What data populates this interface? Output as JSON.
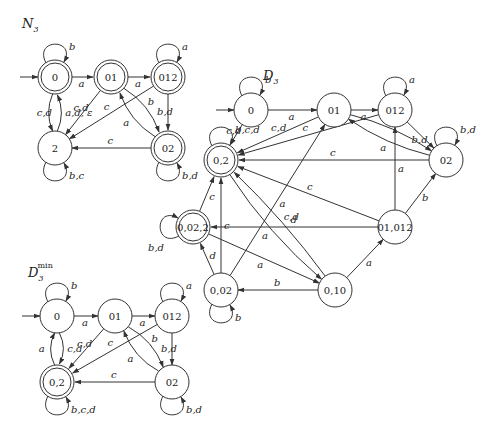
{
  "colors": {
    "stroke": "#333333",
    "text": "#222222",
    "background": "#ffffff"
  },
  "automata": [
    {
      "id": "N3",
      "title": "N",
      "title_sub": "3",
      "title_sup": "",
      "title_pos": [
        22,
        28
      ],
      "states": [
        {
          "id": "0",
          "label": "0",
          "x": 55,
          "y": 77,
          "accepting": true,
          "initial": true
        },
        {
          "id": "01",
          "label": "01",
          "x": 111,
          "y": 77,
          "accepting": true
        },
        {
          "id": "012",
          "label": "012",
          "x": 168,
          "y": 77,
          "accepting": true
        },
        {
          "id": "02",
          "label": "02",
          "x": 168,
          "y": 148,
          "accepting": true
        },
        {
          "id": "2",
          "label": "2",
          "x": 55,
          "y": 148,
          "accepting": false
        }
      ],
      "edges": [
        {
          "from": "0",
          "to": "0",
          "label": "b",
          "loop": "top"
        },
        {
          "from": "0",
          "to": "01",
          "label": "a"
        },
        {
          "from": "01",
          "to": "012",
          "label": "a"
        },
        {
          "from": "012",
          "to": "012",
          "label": "a",
          "loop": "top"
        },
        {
          "from": "0",
          "to": "2",
          "label": "c,d",
          "bend": 8
        },
        {
          "from": "2",
          "to": "0",
          "label": "a,d, ε",
          "bend": 8
        },
        {
          "from": "01",
          "to": "2",
          "label": "c,d"
        },
        {
          "from": "012",
          "to": "2",
          "label": "c"
        },
        {
          "from": "01",
          "to": "02",
          "label": "b",
          "bend": -10
        },
        {
          "from": "02",
          "to": "01",
          "label": "a",
          "bend": -10
        },
        {
          "from": "012",
          "to": "02",
          "label": "b,d"
        },
        {
          "from": "02",
          "to": "2",
          "label": "c"
        },
        {
          "from": "02",
          "to": "02",
          "label": "b,d",
          "loop": "bottom"
        },
        {
          "from": "2",
          "to": "2",
          "label": "b,c",
          "loop": "bottom"
        }
      ]
    },
    {
      "id": "D3",
      "title": "D",
      "title_sub": "3",
      "title_sup": "",
      "title_pos": [
        263,
        80
      ],
      "states": [
        {
          "id": "0",
          "label": "0",
          "x": 251,
          "y": 110,
          "accepting": false,
          "initial": true
        },
        {
          "id": "01",
          "label": "01",
          "x": 334,
          "y": 110,
          "accepting": false
        },
        {
          "id": "012",
          "label": "012",
          "x": 395,
          "y": 110,
          "accepting": false
        },
        {
          "id": "02",
          "label": "02",
          "x": 446,
          "y": 160,
          "accepting": false
        },
        {
          "id": "0,2",
          "label": "0,2",
          "x": 221,
          "y": 160,
          "accepting": true
        },
        {
          "id": "0,02,2",
          "label": "0,02,2",
          "x": 193,
          "y": 227,
          "accepting": true
        },
        {
          "id": "01,012",
          "label": "01,012",
          "x": 395,
          "y": 227,
          "accepting": false
        },
        {
          "id": "0,02",
          "label": "0,02",
          "x": 221,
          "y": 290,
          "accepting": false
        },
        {
          "id": "0,10",
          "label": "0,10",
          "x": 335,
          "y": 290,
          "accepting": false
        }
      ],
      "edges": [
        {
          "from": "0",
          "to": "0",
          "label": "b",
          "loop": "top"
        },
        {
          "from": "0",
          "to": "01",
          "label": "a"
        },
        {
          "from": "01",
          "to": "012",
          "label": "a"
        },
        {
          "from": "012",
          "to": "012",
          "label": "a",
          "loop": "top"
        },
        {
          "from": "0,2",
          "to": "0,2",
          "label": "b,c,d",
          "loop": "top"
        },
        {
          "from": "02",
          "to": "02",
          "label": "b,d",
          "loop": "top"
        },
        {
          "from": "0,02,2",
          "to": "0,02,2",
          "label": "b,d",
          "loop": "left"
        },
        {
          "from": "0,02",
          "to": "0,02",
          "label": "b",
          "loop": "bottom"
        },
        {
          "from": "0",
          "to": "0,2",
          "label": "c,d"
        },
        {
          "from": "01",
          "to": "0,2",
          "label": "c,d"
        },
        {
          "from": "012",
          "to": "0,2",
          "label": "c"
        },
        {
          "from": "02",
          "to": "0,2",
          "label": "c"
        },
        {
          "from": "012",
          "to": "02",
          "label": "b,d"
        },
        {
          "from": "01",
          "to": "02",
          "label": "b",
          "bend": -8
        },
        {
          "from": "02",
          "to": "01",
          "label": "a",
          "bend": -8
        },
        {
          "from": "01,012",
          "to": "0,2",
          "label": "c"
        },
        {
          "from": "01,012",
          "to": "0,02,2",
          "label": "d"
        },
        {
          "from": "01,012",
          "to": "012",
          "label": "a"
        },
        {
          "from": "01,012",
          "to": "02",
          "label": "b"
        },
        {
          "from": "0,02,2",
          "to": "0,2",
          "label": "c"
        },
        {
          "from": "0,02,2",
          "to": "0,10",
          "label": "a"
        },
        {
          "from": "0,02",
          "to": "0,2",
          "label": "c"
        },
        {
          "from": "0,02",
          "to": "0,02,2",
          "label": "d"
        },
        {
          "from": "0,02",
          "to": "01",
          "label": "a"
        },
        {
          "from": "0,10",
          "to": "0,02",
          "label": "b"
        },
        {
          "from": "0,10",
          "to": "0,2",
          "label": "c,d",
          "bend": 6
        },
        {
          "from": "0,2",
          "to": "0,10",
          "label": "a",
          "bend": 10
        },
        {
          "from": "0,10",
          "to": "01,012",
          "label": "a"
        }
      ]
    },
    {
      "id": "D3min",
      "title": "D",
      "title_sub": "3",
      "title_sup": "min",
      "title_pos": [
        28,
        277
      ],
      "states": [
        {
          "id": "0",
          "label": "0",
          "x": 57,
          "y": 316,
          "accepting": false,
          "initial": true
        },
        {
          "id": "01",
          "label": "01",
          "x": 115,
          "y": 316,
          "accepting": false
        },
        {
          "id": "012",
          "label": "012",
          "x": 172,
          "y": 316,
          "accepting": false
        },
        {
          "id": "02",
          "label": "02",
          "x": 172,
          "y": 382,
          "accepting": false
        },
        {
          "id": "0,2",
          "label": "0,2",
          "x": 57,
          "y": 382,
          "accepting": true
        }
      ],
      "edges": [
        {
          "from": "0",
          "to": "0",
          "label": "b",
          "loop": "top"
        },
        {
          "from": "0",
          "to": "01",
          "label": "a"
        },
        {
          "from": "01",
          "to": "012",
          "label": "a"
        },
        {
          "from": "012",
          "to": "012",
          "label": "a",
          "loop": "top"
        },
        {
          "from": "0",
          "to": "0,2",
          "label": "c,d",
          "bend": -8
        },
        {
          "from": "0,2",
          "to": "0",
          "label": "a",
          "bend": -8
        },
        {
          "from": "01",
          "to": "0,2",
          "label": "c,d"
        },
        {
          "from": "012",
          "to": "0,2",
          "label": "c"
        },
        {
          "from": "01",
          "to": "02",
          "label": "b",
          "bend": -10
        },
        {
          "from": "02",
          "to": "01",
          "label": "a",
          "bend": -10
        },
        {
          "from": "012",
          "to": "02",
          "label": "b,d"
        },
        {
          "from": "02",
          "to": "0,2",
          "label": "c"
        },
        {
          "from": "02",
          "to": "02",
          "label": "b,d",
          "loop": "bottom"
        },
        {
          "from": "0,2",
          "to": "0,2",
          "label": "b,c,d",
          "loop": "bottom"
        }
      ]
    }
  ]
}
